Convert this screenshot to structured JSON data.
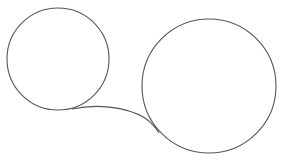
{
  "diagram": {
    "background": "#ffffff",
    "stroke_color": "#555555",
    "shapes": [
      {
        "id": "small-circle",
        "type": "circle",
        "cx": 58,
        "cy": 59,
        "r": 51
      },
      {
        "id": "large-circle",
        "type": "circle",
        "cx": 209,
        "cy": 86,
        "r": 67
      },
      {
        "id": "connector-curve",
        "type": "curve",
        "from": [
          72,
          109
        ],
        "to": [
          159,
          133
        ]
      }
    ]
  }
}
